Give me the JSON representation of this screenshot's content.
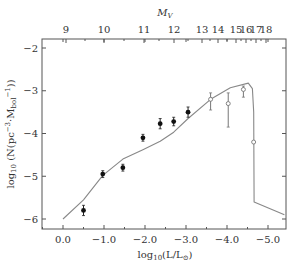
{
  "chart_data": {
    "type": "scatter",
    "title": "",
    "xlabel": "log10(L/L⊙)",
    "ylabel": "log10 (N(pc⁻³·Mbol⁻¹))",
    "top_xlabel": "M_V",
    "xlim": [
      0.5,
      -5.5
    ],
    "ylim": [
      -6.3,
      -1.8
    ],
    "x_ticks": [
      0.0,
      -1.0,
      -2.0,
      -3.0,
      -4.0,
      -5.0
    ],
    "x_tick_labels": [
      "0.0",
      "−1.0",
      "−2.0",
      "−3.0",
      "−4.0",
      "−5.0"
    ],
    "y_ticks": [
      -2,
      -3,
      -4,
      -5,
      -6
    ],
    "y_tick_labels": [
      "−2",
      "−3",
      "−4",
      "−5",
      "−6"
    ],
    "top_ticks": [
      {
        "label": "9",
        "x": 66
      },
      {
        "label": "10",
        "x": 104
      },
      {
        "label": "11",
        "x": 144
      },
      {
        "label": "12",
        "x": 174
      },
      {
        "label": "13",
        "x": 202
      },
      {
        "label": "14",
        "x": 218
      },
      {
        "label": "15",
        "x": 236
      },
      {
        "label": "16",
        "x": 246
      },
      {
        "label": "17",
        "x": 256
      },
      {
        "label": "18",
        "x": 266
      }
    ],
    "series": [
      {
        "name": "filled data points",
        "marker": "filled-circle",
        "points": [
          {
            "x": -0.5,
            "y": -5.8,
            "err": 0.12
          },
          {
            "x": -0.97,
            "y": -4.95,
            "err": 0.08
          },
          {
            "x": -1.46,
            "y": -4.8,
            "err": 0.08
          },
          {
            "x": -1.95,
            "y": -4.1,
            "err": 0.08
          },
          {
            "x": -2.37,
            "y": -3.77,
            "err": 0.12
          },
          {
            "x": -2.7,
            "y": -3.72,
            "err": 0.1
          },
          {
            "x": -3.05,
            "y": -3.5,
            "err": 0.12
          }
        ]
      },
      {
        "name": "open data points",
        "marker": "open-circle",
        "points": [
          {
            "x": -3.6,
            "y": -3.2,
            "err_low": 0.25,
            "err_high": 0.15
          },
          {
            "x": -4.03,
            "y": -3.3,
            "err_low": 0.55,
            "err_high": 0.25
          },
          {
            "x": -4.4,
            "y": -2.97,
            "err_low": 0.18,
            "err_high": 0.08
          },
          {
            "x": -4.65,
            "y": -4.2,
            "err_low": 0,
            "err_high": 0
          }
        ]
      },
      {
        "name": "model curve",
        "type": "line",
        "x": [
          0.0,
          -0.5,
          -0.97,
          -1.46,
          -1.95,
          -2.37,
          -2.7,
          -3.05,
          -3.6,
          -4.08,
          -4.52,
          -4.62,
          -4.65,
          -4.66,
          -5.4
        ],
        "y": [
          -6.0,
          -5.55,
          -4.98,
          -4.6,
          -4.38,
          -4.18,
          -3.97,
          -3.65,
          -3.2,
          -2.93,
          -2.82,
          -2.95,
          -3.5,
          -5.6,
          -5.9
        ]
      }
    ]
  }
}
